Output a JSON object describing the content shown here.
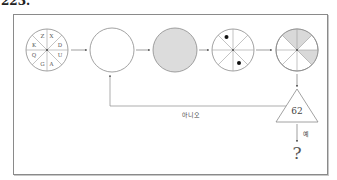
{
  "header": {
    "number": "223."
  },
  "diagram": {
    "colors": {
      "line": "#8a8a8a",
      "shade": "#d9d9d9",
      "fill": "#dcdcdc",
      "dot": "#111111"
    },
    "circle1": {
      "letters": [
        "Z",
        "X",
        "D",
        "U",
        "A",
        "G",
        "Q",
        "K"
      ]
    },
    "circle2": {
      "label": "empty circle"
    },
    "circle3": {
      "label": "gray filled circle"
    },
    "circle4": {
      "dots_in_segments": [
        "top-left",
        "bottom-right"
      ]
    },
    "circle5": {
      "shaded_segments": [
        "top-left",
        "top-right",
        "right-lower"
      ]
    },
    "decision": {
      "value": "62"
    },
    "edges": {
      "no_label": "아니오",
      "yes_label": "예"
    },
    "result": {
      "symbol": "?"
    }
  }
}
